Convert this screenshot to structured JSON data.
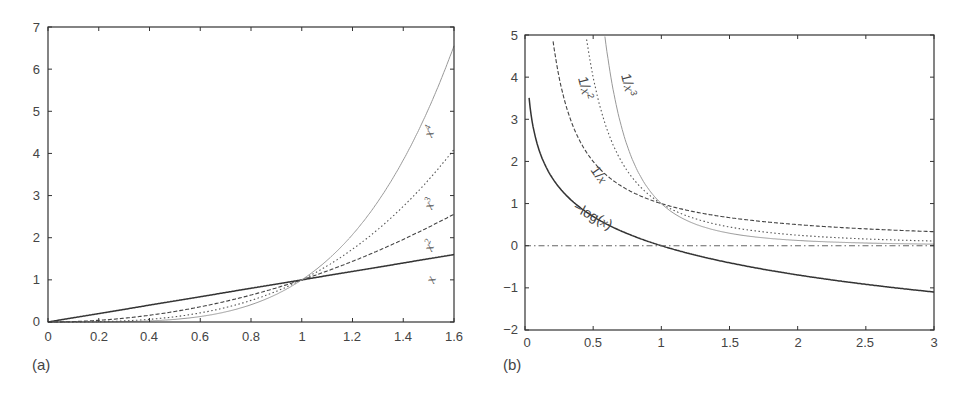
{
  "chart_data": [
    {
      "panel": "(a)",
      "type": "line",
      "title": "",
      "xlabel": "",
      "ylabel": "",
      "xlim": [
        0,
        1.6
      ],
      "ylim": [
        0,
        7
      ],
      "grid": false,
      "legend_position": "inline labels near right edge",
      "x_ticks": [
        "0",
        "0.2",
        "0.4",
        "0.6",
        "0.8",
        "1",
        "1.2",
        "1.4",
        "1.6"
      ],
      "y_ticks": [
        "0",
        "1",
        "2",
        "3",
        "4",
        "5",
        "6",
        "7"
      ],
      "x": [
        0,
        0.2,
        0.4,
        0.6,
        0.8,
        1.0,
        1.2,
        1.4,
        1.6
      ],
      "series": [
        {
          "name": "x",
          "label": "x",
          "style": "solid dark",
          "values": [
            0,
            0.2,
            0.4,
            0.6,
            0.8,
            1.0,
            1.2,
            1.4,
            1.6
          ]
        },
        {
          "name": "x^2",
          "label": "x²",
          "style": "dashed",
          "values": [
            0,
            0.04,
            0.16,
            0.36,
            0.64,
            1.0,
            1.44,
            1.96,
            2.56
          ]
        },
        {
          "name": "x^3",
          "label": "x³",
          "style": "dotted",
          "values": [
            0,
            0.008,
            0.064,
            0.216,
            0.512,
            1.0,
            1.728,
            2.744,
            4.096
          ]
        },
        {
          "name": "x^4",
          "label": "x⁴",
          "style": "solid light gray",
          "values": [
            0,
            0.0016,
            0.0256,
            0.1296,
            0.4096,
            1.0,
            2.0736,
            3.8416,
            6.5536
          ]
        }
      ],
      "annotations": [
        "x⁴",
        "x³",
        "x²",
        "x"
      ]
    },
    {
      "panel": "(b)",
      "type": "line",
      "title": "",
      "xlabel": "",
      "ylabel": "",
      "xlim": [
        0,
        3
      ],
      "ylim": [
        -2,
        5
      ],
      "grid": false,
      "legend_position": "inline labels along curves",
      "x_ticks": [
        "0",
        "0.5",
        "1",
        "1.5",
        "2",
        "2.5",
        "3"
      ],
      "y_ticks": [
        "−2",
        "−1",
        "0",
        "1",
        "2",
        "3",
        "4",
        "5"
      ],
      "x": [
        0.03,
        0.2,
        0.5,
        0.75,
        1.0,
        1.5,
        2.0,
        2.5,
        3.0
      ],
      "series": [
        {
          "name": "1/x",
          "label": "1/x",
          "style": "dashed",
          "values": [
            33.3,
            5.0,
            2.0,
            1.333,
            1.0,
            0.667,
            0.5,
            0.4,
            0.333
          ]
        },
        {
          "name": "1/x^2",
          "label": "1/x²",
          "style": "dotted",
          "values": [
            1111,
            25.0,
            4.0,
            1.778,
            1.0,
            0.444,
            0.25,
            0.16,
            0.111
          ]
        },
        {
          "name": "1/x^3",
          "label": "1/x³",
          "style": "solid light gray",
          "values": [
            37037,
            125.0,
            8.0,
            2.37,
            1.0,
            0.296,
            0.125,
            0.064,
            0.037
          ]
        },
        {
          "name": "-log(x)",
          "label": "−log(x)",
          "style": "solid dark",
          "values": [
            3.5,
            1.609,
            0.693,
            0.288,
            0.0,
            -0.405,
            -0.693,
            -0.916,
            -1.099
          ]
        },
        {
          "name": "y=0",
          "label": "",
          "style": "dash-dot",
          "values": [
            0,
            0,
            0,
            0,
            0,
            0,
            0,
            0,
            0
          ]
        }
      ],
      "annotations": [
        "1/x²",
        "1/x³",
        "1/x",
        "−log(x)"
      ]
    }
  ],
  "panels": {
    "a": {
      "label": "(a)",
      "x_ticks": [
        "0",
        "0.2",
        "0.4",
        "0.6",
        "0.8",
        "1",
        "1.2",
        "1.4",
        "1.6"
      ],
      "y_ticks": [
        "0",
        "1",
        "2",
        "3",
        "4",
        "5",
        "6",
        "7"
      ],
      "curve_labels": {
        "x4": "x",
        "x4_sup": "4",
        "x3": "x",
        "x3_sup": "3",
        "x2": "x",
        "x2_sup": "2",
        "x1": "x"
      }
    },
    "b": {
      "label": "(b)",
      "x_ticks": [
        "0",
        "0.5",
        "1",
        "1.5",
        "2",
        "2.5",
        "3"
      ],
      "y_ticks": [
        "−2",
        "−1",
        "0",
        "1",
        "2",
        "3",
        "4",
        "5"
      ],
      "curve_labels": {
        "inv_x2_pre": "1/",
        "inv_x2_var": "x",
        "inv_x2_sup": "2",
        "inv_x3_pre": "1/",
        "inv_x3_var": "x",
        "inv_x3_sup": "3",
        "inv_x_pre": "1/",
        "inv_x_var": "x",
        "neglog_pre": "−log(",
        "neglog_var": "x",
        "neglog_post": ")"
      }
    }
  }
}
